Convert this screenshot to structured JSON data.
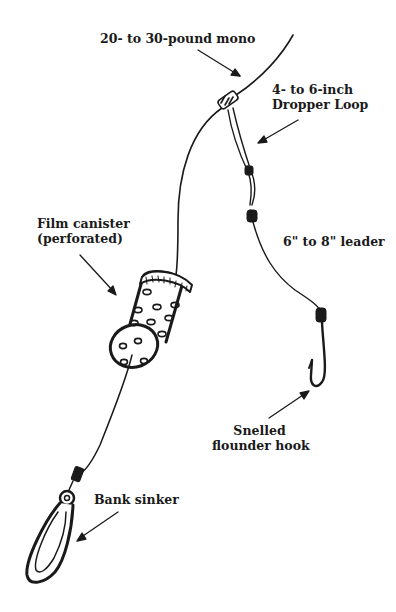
{
  "diagram": {
    "type": "fishing-rig-illustration",
    "labels": {
      "mono": "20- to 30-pound mono",
      "dropper_line1": "4- to 6-inch",
      "dropper_line2": "Dropper Loop",
      "canister_line1": "Film canister",
      "canister_line2": "(perforated)",
      "leader": "6\" to 8\" leader",
      "hook_line1": "Snelled",
      "hook_line2": "flounder hook",
      "sinker": "Bank sinker"
    },
    "colors": {
      "ink": "#1a1a1a",
      "background": "#ffffff"
    }
  }
}
